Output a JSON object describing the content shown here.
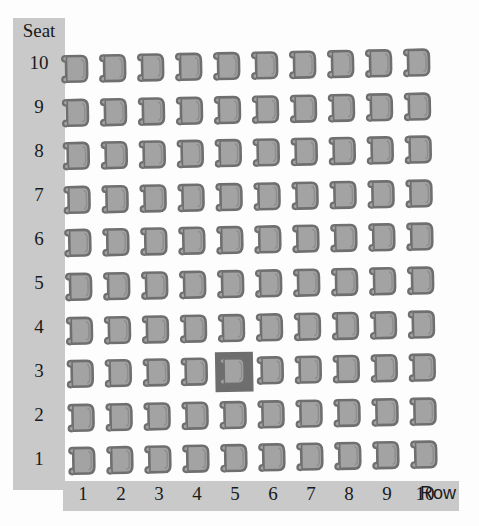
{
  "chart_data": {
    "type": "heatmap",
    "title": "",
    "xlabel": "Row",
    "ylabel": "Seat",
    "x_categories": [
      "1",
      "2",
      "3",
      "4",
      "5",
      "6",
      "7",
      "8",
      "9",
      "10"
    ],
    "y_categories": [
      "10",
      "9",
      "8",
      "7",
      "6",
      "5",
      "4",
      "3",
      "2",
      "1"
    ],
    "grid": false,
    "legend": "none",
    "cell_glyph": "chair-icon",
    "rows": 10,
    "columns": 10,
    "total_seats": 100,
    "selected_cell": {
      "row": 5,
      "seat": 3,
      "label": "Row 5, Seat 3"
    },
    "values": [
      [
        0,
        0,
        0,
        0,
        0,
        0,
        0,
        0,
        0,
        0
      ],
      [
        0,
        0,
        0,
        0,
        0,
        0,
        0,
        0,
        0,
        0
      ],
      [
        0,
        0,
        0,
        0,
        0,
        0,
        0,
        0,
        0,
        0
      ],
      [
        0,
        0,
        0,
        0,
        0,
        0,
        0,
        0,
        0,
        0
      ],
      [
        0,
        0,
        0,
        0,
        0,
        0,
        0,
        0,
        0,
        0
      ],
      [
        0,
        0,
        0,
        0,
        0,
        0,
        0,
        0,
        0,
        0
      ],
      [
        0,
        0,
        0,
        0,
        0,
        0,
        0,
        0,
        0,
        0
      ],
      [
        0,
        0,
        0,
        0,
        1,
        0,
        0,
        0,
        0,
        0
      ],
      [
        0,
        0,
        0,
        0,
        0,
        0,
        0,
        0,
        0,
        0
      ],
      [
        0,
        0,
        0,
        0,
        0,
        0,
        0,
        0,
        0,
        0
      ]
    ]
  },
  "seat_axis": {
    "title": "Seat",
    "ticks": [
      "10",
      "9",
      "8",
      "7",
      "6",
      "5",
      "4",
      "3",
      "2",
      "1"
    ]
  },
  "row_axis": {
    "title": "Row",
    "ticks": [
      "1",
      "2",
      "3",
      "4",
      "5",
      "6",
      "7",
      "8",
      "9",
      "10"
    ]
  },
  "icons": {
    "chair": "chair-icon",
    "selected_chair": "chair-selected-icon"
  },
  "colors": {
    "background": "#fdfdfd",
    "axis_bar": "#c9c9c9",
    "chair_fill": "#a3a3a3",
    "chair_outline": "#6f6f6f",
    "selection_highlight": "#6e6e6e",
    "text": "#1a1a1a"
  }
}
